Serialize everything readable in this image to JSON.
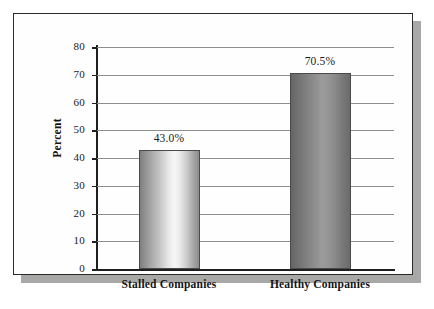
{
  "chart_data": {
    "type": "bar",
    "title": "",
    "xlabel": "",
    "ylabel": "Percent",
    "categories": [
      "Stalled Companies",
      "Healthy Companies"
    ],
    "values": [
      43.0,
      70.5
    ],
    "data_labels": [
      "43.0%",
      "70.5%"
    ],
    "ylim": [
      0,
      80
    ],
    "ytick_values": [
      80,
      70,
      60,
      50,
      40,
      30,
      20,
      10,
      0
    ],
    "ytick_labels": [
      "80",
      "70",
      "60",
      "50",
      "40",
      "30",
      "20",
      "10",
      "0"
    ],
    "grid": true,
    "grid_axis": "y",
    "legend": false,
    "legend_position": "none",
    "bar_styles": [
      {
        "category": "Stalled Companies",
        "fill": "cylindrical-gradient-light",
        "edge_color": "#4a4a4a",
        "light_color": "#f7f7f7",
        "dark_color": "#7e7e7e"
      },
      {
        "category": "Healthy Companies",
        "fill": "cylindrical-gradient-dark",
        "edge_color": "#4a4a4a",
        "light_color": "#9a9a9a",
        "dark_color": "#656565"
      }
    ]
  },
  "figure": {
    "background_color": "#fefefe",
    "border_color": "#2b2b2b",
    "shadow_color": "#a8a8a6",
    "page_background": "#ffffff",
    "axis_color": "#1f1f1f",
    "gridline_color": "#8e8e8e",
    "text_color": "#1a1a1a"
  }
}
